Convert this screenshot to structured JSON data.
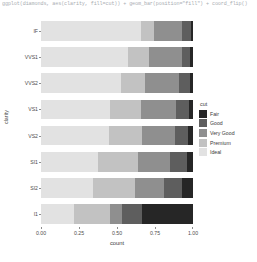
{
  "console": {
    "code": "ggplot(diamonds, aes(clarity, fill=cut)) + geom_bar(position=\"fill\") + coord_flip()"
  },
  "chart_data": {
    "type": "bar",
    "subtype": "stacked-100-horizontal",
    "title": "",
    "xlabel": "count",
    "ylabel": "clarity",
    "xlim": [
      0,
      1
    ],
    "xticks": [
      "0.00",
      "0.25",
      "0.50",
      "0.75",
      "1.00"
    ],
    "xtick_values": [
      0,
      0.25,
      0.5,
      0.75,
      1
    ],
    "grid": false,
    "legend": {
      "title": "cut",
      "position": "right",
      "entries": [
        {
          "label": "Fair",
          "color": "#262626"
        },
        {
          "label": "Good",
          "color": "#5e5e5e"
        },
        {
          "label": "Very Good",
          "color": "#8f8f8f"
        },
        {
          "label": "Premium",
          "color": "#c2c2c2"
        },
        {
          "label": "Ideal",
          "color": "#e2e2e2"
        }
      ]
    },
    "categories": [
      "IF",
      "VVS1",
      "VVS2",
      "VS1",
      "VS2",
      "SI1",
      "SI2",
      "I1"
    ],
    "series": [
      {
        "name": "Ideal",
        "color": "#e2e2e2",
        "values": [
          0.655,
          0.575,
          0.525,
          0.455,
          0.45,
          0.375,
          0.345,
          0.215
        ]
      },
      {
        "name": "Premium",
        "color": "#c2c2c2",
        "values": [
          0.09,
          0.135,
          0.16,
          0.205,
          0.215,
          0.26,
          0.275,
          0.24
        ]
      },
      {
        "name": "Very Good",
        "color": "#8f8f8f",
        "values": [
          0.18,
          0.215,
          0.22,
          0.225,
          0.215,
          0.215,
          0.19,
          0.08
        ]
      },
      {
        "name": "Good",
        "color": "#5e5e5e",
        "values": [
          0.06,
          0.055,
          0.075,
          0.09,
          0.09,
          0.11,
          0.12,
          0.13
        ]
      },
      {
        "name": "Fair",
        "color": "#262626",
        "values": [
          0.015,
          0.02,
          0.02,
          0.025,
          0.03,
          0.04,
          0.07,
          0.335
        ]
      }
    ]
  }
}
